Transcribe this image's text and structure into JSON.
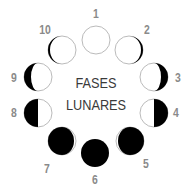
{
  "diagram": {
    "title_lines": [
      "FASES",
      "LUNARES"
    ],
    "colors": {
      "label": "#8a8a8a",
      "title": "#3a3a3a",
      "dark": "#000000",
      "outline": "#bbbbbb"
    },
    "phases": [
      {
        "number": "1",
        "label": "1",
        "shade": "none",
        "cx": 96,
        "cy": 40,
        "lx": 96,
        "ly": 14
      },
      {
        "number": "2",
        "label": "2",
        "shade": "thin-right",
        "cx": 129,
        "cy": 50,
        "lx": 147,
        "ly": 30
      },
      {
        "number": "3",
        "label": "3",
        "shade": "crescent-right",
        "cx": 154,
        "cy": 77,
        "lx": 178,
        "ly": 78
      },
      {
        "number": "4",
        "label": "4",
        "shade": "half-right",
        "cx": 154,
        "cy": 113,
        "lx": 176,
        "ly": 113
      },
      {
        "number": "5",
        "label": "5",
        "shade": "gibbous-right",
        "cx": 130,
        "cy": 141,
        "lx": 146,
        "ly": 164
      },
      {
        "number": "6",
        "label": "6",
        "shade": "full",
        "cx": 95,
        "cy": 153,
        "lx": 95,
        "ly": 180
      },
      {
        "number": "7",
        "label": "7",
        "shade": "gibbous-left",
        "cx": 62,
        "cy": 141,
        "lx": 47,
        "ly": 169
      },
      {
        "number": "8",
        "label": "8",
        "shade": "half-left",
        "cx": 38,
        "cy": 113,
        "lx": 14,
        "ly": 113
      },
      {
        "number": "9",
        "label": "9",
        "shade": "crescent-left",
        "cx": 38,
        "cy": 77,
        "lx": 14,
        "ly": 78
      },
      {
        "number": "10",
        "label": "10",
        "shade": "thin-left",
        "cx": 62,
        "cy": 50,
        "lx": 45,
        "ly": 30
      }
    ]
  }
}
